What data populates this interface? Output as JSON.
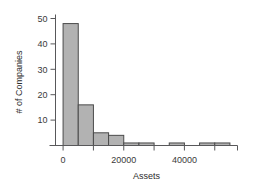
{
  "chart_data": {
    "type": "bar",
    "title": "",
    "subtitle": "",
    "xlabel": "Assets",
    "ylabel": "# of Companies",
    "xlim": [
      -2500,
      57500
    ],
    "ylim": [
      0,
      50
    ],
    "grid": false,
    "legend": null,
    "bin_width": 5000,
    "bin_starts": [
      0,
      5000,
      10000,
      15000,
      20000,
      25000,
      30000,
      35000,
      40000,
      45000,
      50000
    ],
    "categories": [
      "0-5000",
      "5000-10000",
      "10000-15000",
      "15000-20000",
      "20000-25000",
      "25000-30000",
      "30000-35000",
      "35000-40000",
      "40000-45000",
      "45000-50000",
      "50000-55000"
    ],
    "values": [
      48,
      16,
      5,
      4,
      1,
      1,
      0,
      1,
      0,
      1,
      1
    ],
    "x_ticks": [
      0,
      20000,
      40000
    ],
    "x_tick_labels": [
      "0",
      "20000",
      "40000"
    ],
    "x_minor_ticks": [
      0,
      10000,
      20000,
      30000,
      40000,
      50000
    ],
    "y_ticks": [
      10,
      20,
      30,
      40,
      50
    ],
    "y_tick_labels": [
      "10",
      "20",
      "30",
      "40",
      "50"
    ]
  },
  "style": {
    "bar_fill": "#b2b2b2",
    "bar_stroke": "#4a4a4a",
    "axis_color": "#58585a",
    "text_color": "#2c2c2c",
    "background": "#ffffff"
  }
}
